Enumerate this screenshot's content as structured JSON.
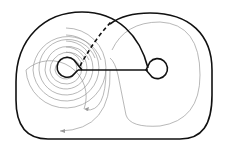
{
  "diagram": {
    "title": "",
    "background": "#ffffff",
    "colors": {
      "curve": "#111111",
      "flow_lines": "#9a9a9a"
    },
    "elements": {
      "outer_boundary": "closed surface boundary",
      "left_loop": "left handle loop",
      "right_loop": "right handle loop",
      "connecting_segment": "horizontal segment between loops",
      "dashed_arc": "hidden arc (dashed)",
      "solid_arc": "front arc",
      "spiral_flow": "gray spiral flow lines around left loop",
      "return_flow": "gray flow line around right region"
    }
  }
}
